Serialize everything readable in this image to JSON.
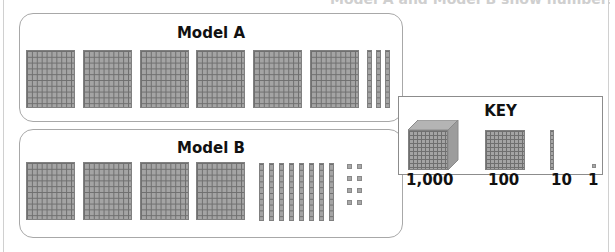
{
  "header": {
    "clipped_title": "Model A and Model B show numbers"
  },
  "models": [
    {
      "title": "Model A",
      "hundreds": 6,
      "tens": 3,
      "ones": 0
    },
    {
      "title": "Model B",
      "hundreds": 4,
      "tens": 8,
      "ones": 8
    }
  ],
  "key": {
    "title": "KEY",
    "items": [
      {
        "label": "1,000",
        "icon": "thousand-cube-icon"
      },
      {
        "label": "100",
        "icon": "hundred-flat-icon"
      },
      {
        "label": "10",
        "icon": "ten-rod-icon"
      },
      {
        "label": "1",
        "icon": "one-unit-icon"
      }
    ]
  },
  "colors": {
    "block_fill": "#a4a4a4",
    "grid_line": "#6f6f6f",
    "panel_border": "#a8a8a8"
  }
}
